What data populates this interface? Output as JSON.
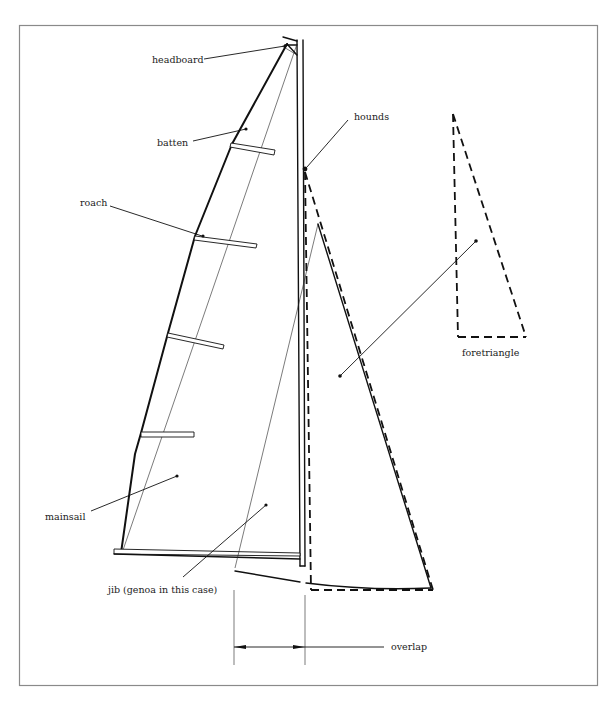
{
  "diagram": {
    "labels": {
      "headboard": "headboard",
      "hounds": "hounds",
      "batten": "batten",
      "roach": "roach",
      "foretriangle": "foretriangle",
      "mainsail": "mainsail",
      "jib": "jib (genoa in this case)",
      "overlap": "overlap"
    },
    "colors": {
      "line": "#111111",
      "frame": "#8a8a8a",
      "background": "#ffffff"
    },
    "parts": [
      "mast",
      "boom",
      "mainsail",
      "battens",
      "jib",
      "forestay",
      "foretriangle",
      "overlap-dimension"
    ]
  }
}
